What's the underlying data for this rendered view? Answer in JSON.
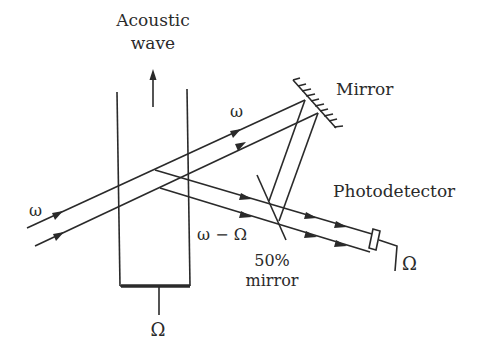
{
  "figure": {
    "labels": {
      "acoustic_wave_line1": "Acoustic",
      "acoustic_wave_line2": "wave",
      "incident_frequency": "ω",
      "upper_beam_frequency": "ω",
      "shifted_frequency": "ω − Ω",
      "mirror": "Mirror",
      "half_mirror_line1": "50%",
      "half_mirror_line2": "mirror",
      "photodetector": "Photodetector",
      "detector_output": "Ω",
      "transducer_drive": "Ω"
    },
    "components": [
      {
        "name": "acoustic-cell",
        "description": "Vertical cell containing acoustic wave traveling upward"
      },
      {
        "name": "transducer",
        "description": "Thick bar at bottom of cell driven at frequency Ω"
      },
      {
        "name": "mirror",
        "description": "Fully reflecting mirror, upper right"
      },
      {
        "name": "half-mirror",
        "description": "50% beam-combining mirror"
      },
      {
        "name": "photodetector",
        "description": "Detector outputting beat signal at Ω"
      }
    ],
    "colors": {
      "ink": "#2a2a2a",
      "background": "#ffffff"
    }
  }
}
